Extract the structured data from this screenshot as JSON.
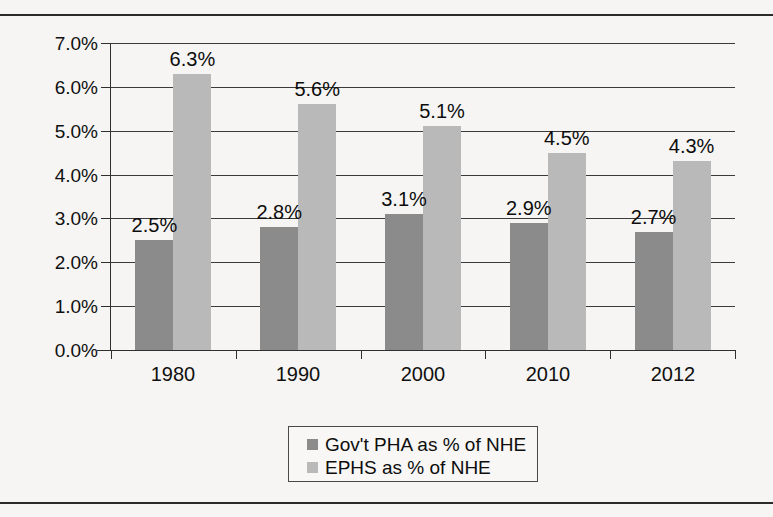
{
  "chart_data": {
    "type": "bar",
    "title": "",
    "subtitle": "",
    "xlabel": "",
    "ylabel": "",
    "categories": [
      "1980",
      "1990",
      "2000",
      "2010",
      "2012"
    ],
    "series": [
      {
        "name": "Gov't PHA as % of NHE",
        "color": "#8b8b8b",
        "values": [
          2.5,
          2.8,
          3.1,
          2.9,
          2.7
        ],
        "labels": [
          "2.5%",
          "2.8%",
          "3.1%",
          "2.9%",
          "2.7%"
        ]
      },
      {
        "name": "EPHS as % of NHE",
        "color": "#b9b9b9",
        "values": [
          6.3,
          5.6,
          5.1,
          4.5,
          4.3
        ],
        "labels": [
          "6.3%",
          "5.6%",
          "5.1%",
          "4.5%",
          "4.3%"
        ]
      }
    ],
    "ylim": [
      0,
      7
    ],
    "ytick_values": [
      0,
      1,
      2,
      3,
      4,
      5,
      6,
      7
    ],
    "ytick_labels": [
      "0.0%",
      "1.0%",
      "2.0%",
      "3.0%",
      "4.0%",
      "5.0%",
      "6.0%",
      "7.0%"
    ],
    "grid": true,
    "legend_position": "bottom-center",
    "value_labels_shown": true
  }
}
